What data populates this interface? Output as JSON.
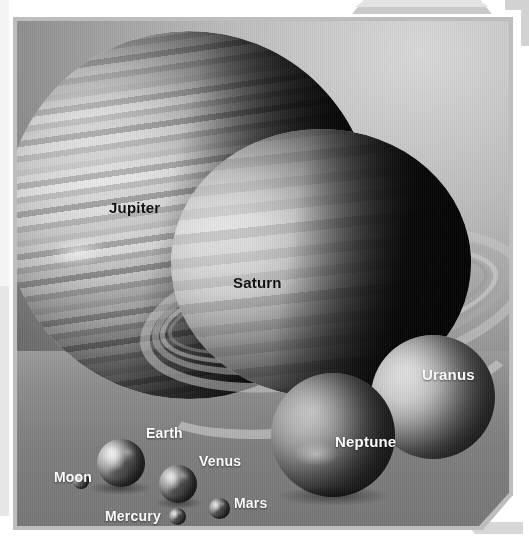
{
  "figure": {
    "kind": "solar-system-size-comparison",
    "style": "grayscale photo-composite inside a beveled tech-frame panel"
  },
  "labels": {
    "jupiter": "Jupiter",
    "saturn": "Saturn",
    "uranus": "Uranus",
    "neptune": "Neptune",
    "earth": "Earth",
    "venus": "Venus",
    "moon": "Moon",
    "mars": "Mars",
    "mercury": "Mercury",
    "pluto": "Pluto"
  },
  "bodies": [
    {
      "name": "Jupiter",
      "label": "Jupiter",
      "label_color": "#0c0c0c",
      "relative_size": "largest",
      "group": "gas-giant"
    },
    {
      "name": "Saturn",
      "label": "Saturn",
      "label_color": "#0c0c0c",
      "relative_size": "second",
      "group": "gas-giant",
      "has_rings": true
    },
    {
      "name": "Uranus",
      "label": "Uranus",
      "label_color": "#ffffff",
      "relative_size": "third",
      "group": "ice-giant"
    },
    {
      "name": "Neptune",
      "label": "Neptune",
      "label_color": "#ffffff",
      "relative_size": "fourth",
      "group": "ice-giant"
    },
    {
      "name": "Earth",
      "label": "Earth",
      "label_color": "#ffffff",
      "relative_size": "fifth",
      "group": "terrestrial"
    },
    {
      "name": "Venus",
      "label": "Venus",
      "label_color": "#ffffff",
      "relative_size": "sixth",
      "group": "terrestrial"
    },
    {
      "name": "Mars",
      "label": "Mars",
      "label_color": "#ffffff",
      "relative_size": "seventh",
      "group": "terrestrial"
    },
    {
      "name": "Mercury",
      "label": "Mercury",
      "label_color": "#ffffff",
      "relative_size": "eighth",
      "group": "terrestrial"
    },
    {
      "name": "Moon",
      "label": "Moon",
      "label_color": "#ffffff",
      "relative_size": "ninth",
      "group": "satellite"
    },
    {
      "name": "Pluto",
      "label": "Pluto",
      "label_color": "#ffffff",
      "relative_size": "smallest",
      "group": "dwarf-planet"
    }
  ],
  "colors": {
    "page_background": "#ffffff",
    "frame_border": "#bdbdbd",
    "sky_light": "#d9d9d9",
    "sky_dark": "#4a4a4a",
    "floor": "#7d7d7d",
    "label_dark": "#0c0c0c",
    "label_light": "#ffffff",
    "chrome_accent": "#c9c9c9"
  }
}
